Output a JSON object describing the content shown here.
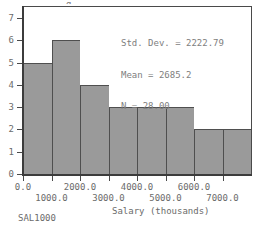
{
  "chart_data": {
    "type": "bar",
    "title": "",
    "xlabel": "Salary (thousands)",
    "ylabel": "",
    "categories": [
      "0-1000",
      "1000-2000",
      "2000-3000",
      "3000-4000",
      "4000-5000",
      "5000-6000",
      "6000-7000",
      "7000-8000"
    ],
    "values": [
      5,
      6,
      4,
      3,
      3,
      3,
      2,
      2
    ],
    "bin_width": 1000,
    "bin_starts": [
      0,
      1000,
      2000,
      3000,
      4000,
      5000,
      6000,
      7000
    ],
    "ylim": [
      0,
      7.5
    ],
    "xlim": [
      0,
      8000
    ],
    "grid": false,
    "legend": false,
    "bar_color": "#9a9a9a",
    "bar_edge_color": "#4f4f4f",
    "y_ticks": [
      "0",
      "1",
      "2",
      "3",
      "4",
      "5",
      "6",
      "7"
    ],
    "y_tick_values": [
      0,
      1,
      2,
      3,
      4,
      5,
      6,
      7
    ],
    "x_ticks_top": [
      "0.0",
      "2000.0",
      "4000.0",
      "6000.0"
    ],
    "x_tick_values_top": [
      0,
      2000,
      4000,
      6000
    ],
    "x_ticks_bottom": [
      "1000.0",
      "3000.0",
      "5000.0",
      "7000.0"
    ],
    "x_tick_values_bottom": [
      1000,
      3000,
      5000,
      7000
    ],
    "annotations": {
      "std_dev": "Std. Dev. = 2222.79",
      "mean": "Mean = 2685.2",
      "n": "N = 28.00"
    },
    "statistics": {
      "std_dev_value": 2222.79,
      "mean_value": 2685.2,
      "n_value": 28.0
    }
  },
  "chart": {
    "case_label": "SAL1000",
    "title_sliver": "g"
  }
}
